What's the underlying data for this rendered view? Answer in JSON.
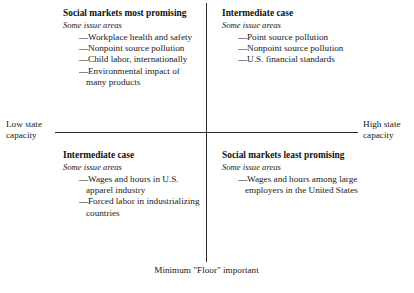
{
  "figure": {
    "type": "2x2-matrix",
    "axes": {
      "horizontal_left_label": "Low state capacity",
      "horizontal_right_label": "High state capacity",
      "bottom_caption": "Minimum \"Floor\" important"
    },
    "bullet_marker": "—",
    "line_color": "#2b2b2b",
    "text_color": "#1a1a1a",
    "background_color": "#ffffff"
  },
  "quadrants": {
    "top_left": {
      "title": "Social markets most promising",
      "subtitle": "Some issue areas",
      "items": [
        "Workplace health and safety",
        "Nonpoint source pollution",
        "Child labor, internationally",
        "Environmental impact of many products"
      ]
    },
    "top_right": {
      "title": "Intermediate case",
      "subtitle": "Some issue areas",
      "items": [
        "Point source pollution",
        "Nonpoint source pollution",
        "U.S. financial standards"
      ]
    },
    "bottom_left": {
      "title": "Intermediate case",
      "subtitle": "Some issue areas",
      "items": [
        "Wages and hours in U.S. apparel industry",
        "Forced labor in industrializing countries"
      ]
    },
    "bottom_right": {
      "title": "Social markets least promising",
      "subtitle": "Some issue areas",
      "items": [
        "Wages and hours among large employers in the United States"
      ]
    }
  }
}
